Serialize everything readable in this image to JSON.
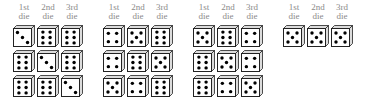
{
  "column_labels": [
    {
      "line1": "1st",
      "line2": "die"
    },
    {
      "line1": "2nd",
      "line2": "die"
    },
    {
      "line1": "3rd",
      "line2": "die"
    }
  ],
  "groups": [
    {
      "rolls": [
        [
          3,
          6,
          6
        ],
        [
          6,
          3,
          6
        ],
        [
          6,
          6,
          3
        ]
      ]
    },
    {
      "rolls": [
        [
          4,
          5,
          6
        ],
        [
          4,
          6,
          5
        ],
        [
          5,
          4,
          6
        ]
      ]
    },
    {
      "rolls": [
        [
          5,
          6,
          4
        ],
        [
          6,
          5,
          4
        ],
        [
          6,
          4,
          5
        ]
      ]
    },
    {
      "rolls": [
        [
          5,
          5,
          5
        ]
      ]
    }
  ],
  "colors": {
    "pip": "#000000",
    "face": "#ffffff",
    "edge": "#222222",
    "side": "#dcdcdc",
    "label": "#8a8a8a"
  }
}
